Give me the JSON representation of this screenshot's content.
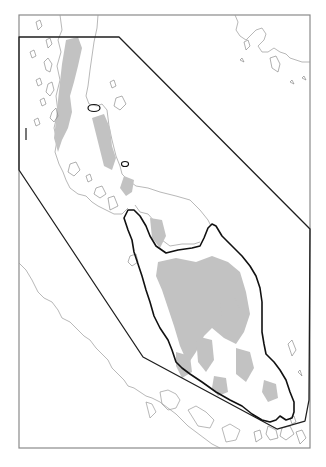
{
  "map": {
    "title": "",
    "style": {
      "frame_color": "#8a8a8a",
      "coast_color": "#9a9a9a",
      "highland_color": "#c2c2c2",
      "region_outline_color": "#1e1e1e",
      "study_outline_color": "#111111",
      "background": "#ffffff"
    },
    "frame": {
      "x": 19,
      "y": 15,
      "width": 291,
      "height": 433
    },
    "layers": [
      {
        "name": "coastlines",
        "description": "thin grey coastlines of mainland and islands"
      },
      {
        "name": "highlands",
        "description": "grey shaded elevated terrain"
      },
      {
        "name": "bounding-polygon",
        "description": "black polygon enclosing peninsula region"
      },
      {
        "name": "peninsula-outline",
        "description": "bold black outline of southern peninsula"
      }
    ],
    "side_label": {
      "text": "",
      "note": "tiny illegible vertical label on left margin"
    }
  }
}
